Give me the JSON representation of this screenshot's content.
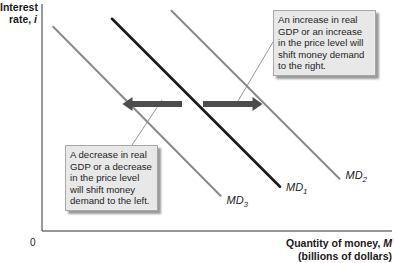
{
  "chart_data": {
    "type": "line",
    "title": "",
    "xlabel": {
      "line1": "Quantity of money, ",
      "symbol": "M",
      "line2": "(billions of dollars)"
    },
    "ylabel": {
      "line1": "Interest",
      "line2": "rate, ",
      "symbol": "i"
    },
    "origin_label": "0",
    "grid": false,
    "xlim": [
      0,
      100
    ],
    "ylim": [
      0,
      100
    ],
    "series": [
      {
        "name": "MD3",
        "base": "MD",
        "sub": "3",
        "color": "#8a8a8a",
        "points": [
          [
            3.2,
            90
          ],
          [
            51,
            15.5
          ]
        ]
      },
      {
        "name": "MD1",
        "base": "MD",
        "sub": "1",
        "color": "#1a1a1a",
        "points": [
          [
            20,
            93.5
          ],
          [
            68,
            19.5
          ]
        ]
      },
      {
        "name": "MD2",
        "base": "MD",
        "sub": "2",
        "color": "#8a8a8a",
        "points": [
          [
            37,
            97
          ],
          [
            85,
            23
          ]
        ]
      }
    ],
    "arrows": [
      {
        "name": "shift-left-arrow",
        "direction": "left",
        "color": "#4d4d4d",
        "from": [
          40,
          56
        ],
        "to": [
          23,
          56
        ]
      },
      {
        "name": "shift-right-arrow",
        "direction": "right",
        "color": "#4d4d4d",
        "from": [
          46,
          56
        ],
        "to": [
          63,
          56
        ]
      }
    ],
    "annotations": [
      {
        "name": "increase-note",
        "text": "An increase in real GDP or an increase in the price level will shift money demand to the right."
      },
      {
        "name": "decrease-note",
        "text": "A decrease in real GDP or a decrease in the price level will shift money demand to the left."
      }
    ]
  }
}
